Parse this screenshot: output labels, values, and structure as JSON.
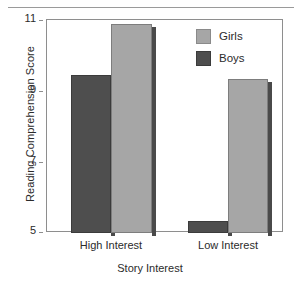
{
  "chart_data": {
    "type": "bar",
    "title": "",
    "xlabel": "Story Interest",
    "ylabel": "Reading Comprehension Score",
    "categories": [
      "High Interest",
      "Low Interest"
    ],
    "series": [
      {
        "name": "Girls",
        "color": "#a6a6a6",
        "values": [
          10.9,
          9.35
        ]
      },
      {
        "name": "Boys",
        "color": "#4e4e4e",
        "values": [
          9.45,
          5.35
        ]
      }
    ],
    "series_order_in_plot": [
      "Boys",
      "Girls"
    ],
    "ylim": [
      5,
      11
    ],
    "yticks": [
      5,
      7,
      9,
      11
    ],
    "ytick_labels": [
      "5",
      "7",
      "9",
      "11"
    ],
    "xtick_labels": [
      "High Interest",
      "Low Interest"
    ],
    "grid": false,
    "legend_position": "top-right",
    "legend_entries": [
      "Girls",
      "Boys"
    ],
    "style": {
      "bar_shadow": true,
      "plot_border": true,
      "top_rule": true
    }
  },
  "axes": {
    "y_title": "Reading Comprehension Score",
    "x_title": "Story Interest",
    "y_ticks": [
      {
        "label": "11",
        "value": 11
      },
      {
        "label": "9",
        "value": 9
      },
      {
        "label": "7",
        "value": 7
      },
      {
        "label": "5",
        "value": 5
      }
    ],
    "x_ticks": [
      {
        "label": "High Interest"
      },
      {
        "label": "Low Interest"
      }
    ]
  },
  "legend": {
    "items": [
      {
        "label": "Girls",
        "swatch": "girls-swatch"
      },
      {
        "label": "Boys",
        "swatch": "boys-swatch"
      }
    ]
  },
  "bars": [
    {
      "group": "High Interest",
      "series": "Boys",
      "value": 9.45
    },
    {
      "group": "High Interest",
      "series": "Girls",
      "value": 10.9
    },
    {
      "group": "Low Interest",
      "series": "Boys",
      "value": 5.35
    },
    {
      "group": "Low Interest",
      "series": "Girls",
      "value": 9.35
    }
  ]
}
